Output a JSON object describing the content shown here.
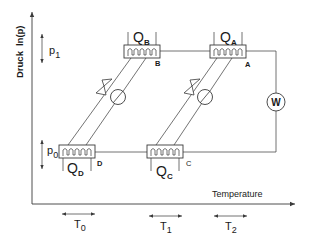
{
  "diagram": {
    "type": "pressure-temperature cycle diagram (absorption heat pump)",
    "y_axis": {
      "label_main": "Druck",
      "label_sub": "ln(p)"
    },
    "x_axis": {
      "label": "Temperature"
    },
    "pressure_levels": [
      {
        "id": "p1",
        "label": "p",
        "subscript": "1"
      },
      {
        "id": "p0",
        "label": "p",
        "subscript": "0"
      }
    ],
    "temperature_levels": [
      {
        "id": "T0",
        "label": "T",
        "subscript": "0"
      },
      {
        "id": "T1",
        "label": "T",
        "subscript": "1"
      },
      {
        "id": "T2",
        "label": "T",
        "subscript": "2"
      }
    ],
    "heat_exchangers": [
      {
        "id": "B",
        "point_label": "B",
        "heat_label": "Q",
        "heat_subscript": "B"
      },
      {
        "id": "A",
        "point_label": "A",
        "heat_label": "Q",
        "heat_subscript": "A"
      },
      {
        "id": "D",
        "point_label": "D",
        "heat_label": "Q",
        "heat_subscript": "D"
      },
      {
        "id": "C",
        "point_label": "C",
        "heat_label": "Q",
        "heat_subscript": "C"
      }
    ],
    "work_input": {
      "label": "W"
    },
    "colors": {
      "line": "#3a3a3a",
      "text": "#1a1a1a",
      "background": "#ffffff"
    }
  }
}
